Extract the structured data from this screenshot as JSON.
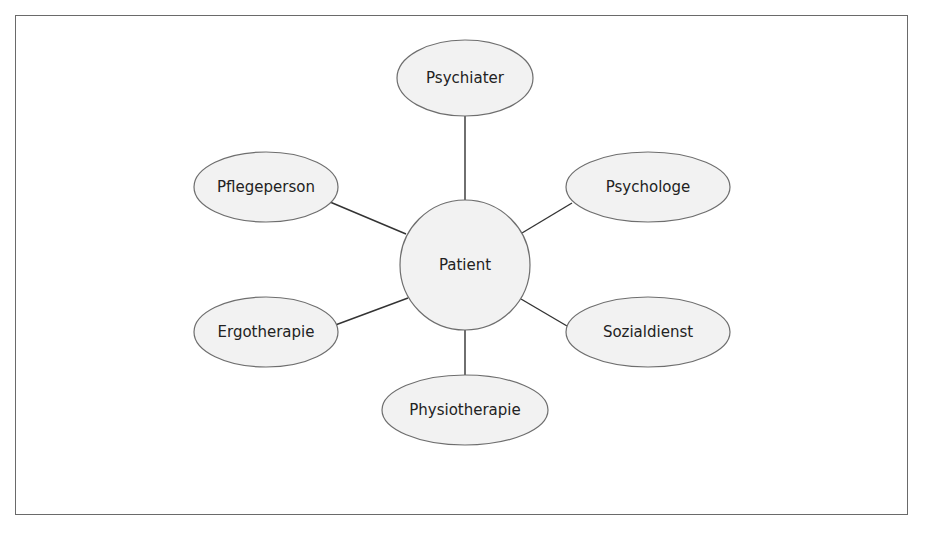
{
  "diagram": {
    "type": "hub-and-spoke",
    "center": {
      "label": "Patient",
      "cx": 465,
      "cy": 265,
      "r": 65
    },
    "nodes": [
      {
        "id": "psychiater",
        "label": "Psychiater",
        "cx": 465,
        "cy": 78,
        "rx": 68,
        "ry": 38
      },
      {
        "id": "pflegeperson",
        "label": "Pflegeperson",
        "cx": 266,
        "cy": 187,
        "rx": 72,
        "ry": 35
      },
      {
        "id": "psychologe",
        "label": "Psychologe",
        "cx": 648,
        "cy": 187,
        "rx": 82,
        "ry": 35
      },
      {
        "id": "ergotherapie",
        "label": "Ergotherapie",
        "cx": 266,
        "cy": 332,
        "rx": 72,
        "ry": 35
      },
      {
        "id": "sozialdienst",
        "label": "Sozialdienst",
        "cx": 648,
        "cy": 332,
        "rx": 82,
        "ry": 35
      },
      {
        "id": "physiotherapie",
        "label": "Physiotherapie",
        "cx": 465,
        "cy": 410,
        "rx": 83,
        "ry": 35
      }
    ],
    "edges": [
      {
        "from": "Patient",
        "to": "Psychiater"
      },
      {
        "from": "Patient",
        "to": "Pflegeperson"
      },
      {
        "from": "Patient",
        "to": "Psychologe"
      },
      {
        "from": "Patient",
        "to": "Ergotherapie"
      },
      {
        "from": "Patient",
        "to": "Sozialdienst"
      },
      {
        "from": "Patient",
        "to": "Physiotherapie"
      }
    ],
    "colors": {
      "fill": "#f2f2f2",
      "stroke": "#6e6e6e",
      "line": "#333333",
      "text": "#222222"
    }
  }
}
